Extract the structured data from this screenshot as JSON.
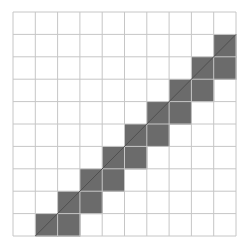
{
  "diagram": {
    "type": "pixelated-line-grid",
    "grid": {
      "rows": 10,
      "cols": 10,
      "origin_x": 13,
      "origin_y": 12,
      "width": 223,
      "height": 224,
      "line_color": "#c6c6c6",
      "background": "#ffffff"
    },
    "shaded_cells": [
      {
        "row": 1,
        "col": 9
      },
      {
        "row": 2,
        "col": 8
      },
      {
        "row": 2,
        "col": 9
      },
      {
        "row": 3,
        "col": 7
      },
      {
        "row": 3,
        "col": 8
      },
      {
        "row": 4,
        "col": 6
      },
      {
        "row": 4,
        "col": 7
      },
      {
        "row": 5,
        "col": 5
      },
      {
        "row": 5,
        "col": 6
      },
      {
        "row": 6,
        "col": 4
      },
      {
        "row": 6,
        "col": 5
      },
      {
        "row": 7,
        "col": 3
      },
      {
        "row": 7,
        "col": 4
      },
      {
        "row": 8,
        "col": 2
      },
      {
        "row": 8,
        "col": 3
      },
      {
        "row": 9,
        "col": 1
      },
      {
        "row": 9,
        "col": 2
      }
    ],
    "shade_color": "#6b6b6b",
    "line": {
      "from": {
        "col": 1,
        "row": 10
      },
      "to": {
        "col": 10,
        "row": 1
      },
      "color": "#4f4f4f",
      "width": 1
    }
  }
}
